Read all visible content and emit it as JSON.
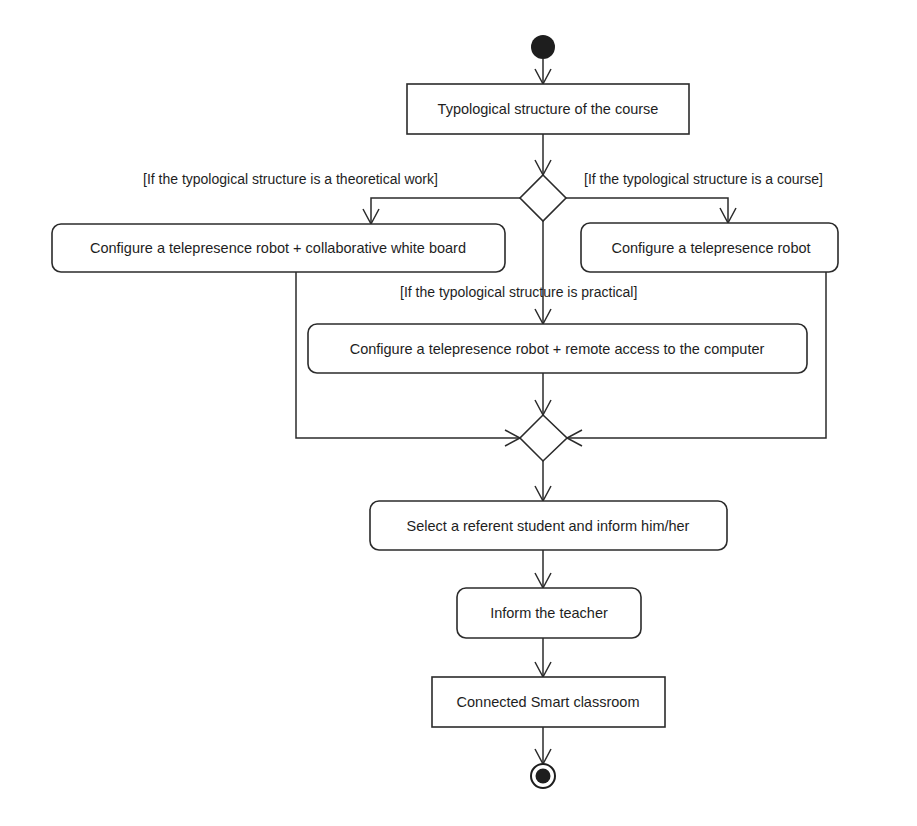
{
  "diagram": {
    "type": "UML activity diagram",
    "initial_node": {
      "label": "start"
    },
    "final_node": {
      "label": "end"
    },
    "actions": [
      {
        "id": "a1",
        "label": "Typological structure of the course",
        "shape": "rect"
      },
      {
        "id": "a2",
        "label": "Configure a telepresence robot + collaborative white board",
        "shape": "rounded"
      },
      {
        "id": "a3",
        "label": "Configure a telepresence robot",
        "shape": "rounded"
      },
      {
        "id": "a4",
        "label": "Configure a telepresence robot + remote access to the computer",
        "shape": "rounded"
      },
      {
        "id": "a5",
        "label": "Select a referent student and inform him/her",
        "shape": "rounded"
      },
      {
        "id": "a6",
        "label": "Inform the teacher",
        "shape": "rounded"
      },
      {
        "id": "a7",
        "label": "Connected Smart classroom",
        "shape": "rect"
      }
    ],
    "guards": {
      "theoretical": "[If the typological structure is a theoretical work]",
      "course": "[If the typological structure is a course]",
      "practical": "[If the typological structure is practical]"
    },
    "edges": [
      {
        "from": "start",
        "to": "a1"
      },
      {
        "from": "a1",
        "to": "decision"
      },
      {
        "from": "decision",
        "to": "a2",
        "guard": "theoretical"
      },
      {
        "from": "decision",
        "to": "a3",
        "guard": "course"
      },
      {
        "from": "decision",
        "to": "a4",
        "guard": "practical"
      },
      {
        "from": "a2",
        "to": "merge"
      },
      {
        "from": "a3",
        "to": "merge"
      },
      {
        "from": "a4",
        "to": "merge"
      },
      {
        "from": "merge",
        "to": "a5"
      },
      {
        "from": "a5",
        "to": "a6"
      },
      {
        "from": "a6",
        "to": "a7"
      },
      {
        "from": "a7",
        "to": "end"
      }
    ],
    "colors": {
      "stroke": "#2b2b2b",
      "text": "#1e1e1e",
      "background": "#ffffff"
    }
  }
}
